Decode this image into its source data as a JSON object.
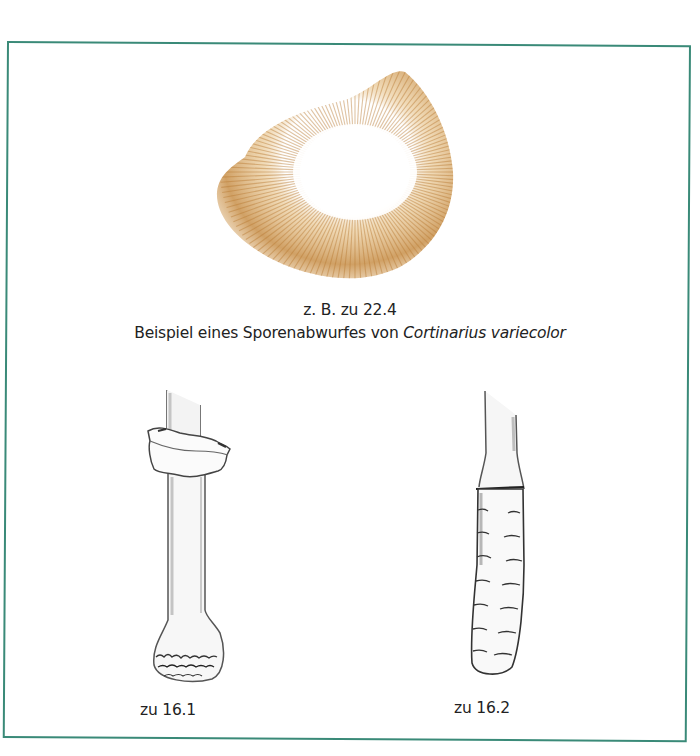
{
  "page": {
    "frame_color": "#3a8a78",
    "spore_color": "#c48a3c"
  },
  "figures": {
    "spore_print": {
      "icon": "spore-print-illustration",
      "caption_ref": "z. B. zu 22.4",
      "caption_prefix": "Beispiel eines Sporenabwurfes von ",
      "caption_species": "Cortinarius variecolor"
    },
    "stem_1": {
      "icon": "stem-with-ring-illustration",
      "caption": "zu 16.1"
    },
    "stem_2": {
      "icon": "scaly-stem-illustration",
      "caption": "zu 16.2"
    }
  }
}
